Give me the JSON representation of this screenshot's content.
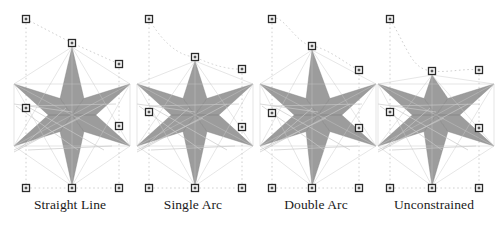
{
  "figure": {
    "background": "#ffffff",
    "width": 495,
    "height": 225,
    "panel_count": 4
  },
  "style": {
    "star_fill": "#808080",
    "star_fill_light": "#9a9a9a",
    "stray_line_color": "#c8c8c8",
    "dashed_color": "#d0d0d0",
    "handle_border": "#2b2b2b",
    "handle_fill": "#ffffff",
    "handle_center": "#555555",
    "caption_color": "#1a1a1a"
  },
  "panels": [
    {
      "id": "straight-line",
      "caption": "Straight Line",
      "top_edge_type": "straight",
      "x": 8,
      "handles": [
        {
          "name": "handle-top-left",
          "x": 18,
          "y": 19
        },
        {
          "name": "handle-top-middle",
          "x": 64,
          "y": 43
        },
        {
          "name": "handle-top-right",
          "x": 111,
          "y": 64
        },
        {
          "name": "handle-mid-left",
          "x": 18,
          "y": 108
        },
        {
          "name": "handle-mid-right",
          "x": 111,
          "y": 126
        },
        {
          "name": "handle-bottom-left",
          "x": 18,
          "y": 188
        },
        {
          "name": "handle-bottom-middle",
          "x": 64,
          "y": 188
        },
        {
          "name": "handle-bottom-right",
          "x": 111,
          "y": 188
        }
      ]
    },
    {
      "id": "single-arc",
      "caption": "Single Arc",
      "top_edge_type": "single-arc",
      "x": 131,
      "handles": [
        {
          "name": "handle-top-left",
          "x": 18,
          "y": 19
        },
        {
          "name": "handle-top-middle",
          "x": 64,
          "y": 57
        },
        {
          "name": "handle-top-right",
          "x": 111,
          "y": 69
        },
        {
          "name": "handle-mid-left",
          "x": 18,
          "y": 112
        },
        {
          "name": "handle-mid-right",
          "x": 111,
          "y": 127
        },
        {
          "name": "handle-bottom-left",
          "x": 18,
          "y": 188
        },
        {
          "name": "handle-bottom-middle",
          "x": 64,
          "y": 188
        },
        {
          "name": "handle-bottom-right",
          "x": 111,
          "y": 188
        }
      ]
    },
    {
      "id": "double-arc",
      "caption": "Double Arc",
      "top_edge_type": "double-arc",
      "x": 254,
      "handles": [
        {
          "name": "handle-top-left",
          "x": 18,
          "y": 19
        },
        {
          "name": "handle-top-middle",
          "x": 58,
          "y": 46
        },
        {
          "name": "handle-top-right",
          "x": 105,
          "y": 70
        },
        {
          "name": "handle-mid-left",
          "x": 18,
          "y": 113
        },
        {
          "name": "handle-mid-right",
          "x": 105,
          "y": 128
        },
        {
          "name": "handle-bottom-left",
          "x": 18,
          "y": 188
        },
        {
          "name": "handle-bottom-middle",
          "x": 58,
          "y": 188
        },
        {
          "name": "handle-bottom-right",
          "x": 105,
          "y": 188
        }
      ]
    },
    {
      "id": "unconstrained",
      "caption": "Unconstrained",
      "top_edge_type": "unconstrained",
      "x": 372,
      "handles": [
        {
          "name": "handle-top-left",
          "x": 18,
          "y": 19
        },
        {
          "name": "handle-top-middle",
          "x": 60,
          "y": 71
        },
        {
          "name": "handle-top-right",
          "x": 107,
          "y": 70
        },
        {
          "name": "handle-mid-left",
          "x": 18,
          "y": 112
        },
        {
          "name": "handle-mid-right",
          "x": 107,
          "y": 128
        },
        {
          "name": "handle-bottom-left",
          "x": 18,
          "y": 188
        },
        {
          "name": "handle-bottom-middle",
          "x": 60,
          "y": 188
        },
        {
          "name": "handle-bottom-right",
          "x": 107,
          "y": 188
        }
      ]
    }
  ],
  "chart_data": {
    "type": "diagram",
    "title": "",
    "categories": [
      "Straight Line",
      "Single Arc",
      "Double Arc",
      "Unconstrained"
    ],
    "series": [
      {
        "name": "top_edge_constraint",
        "values": [
          "straight",
          "single-arc",
          "double-arc",
          "unconstrained"
        ]
      },
      {
        "name": "handles_per_panel",
        "values": [
          8,
          8,
          8,
          8
        ]
      },
      {
        "name": "star_points",
        "values": [
          6,
          6,
          6,
          6
        ]
      }
    ],
    "legend_position": "none",
    "grid": false
  }
}
